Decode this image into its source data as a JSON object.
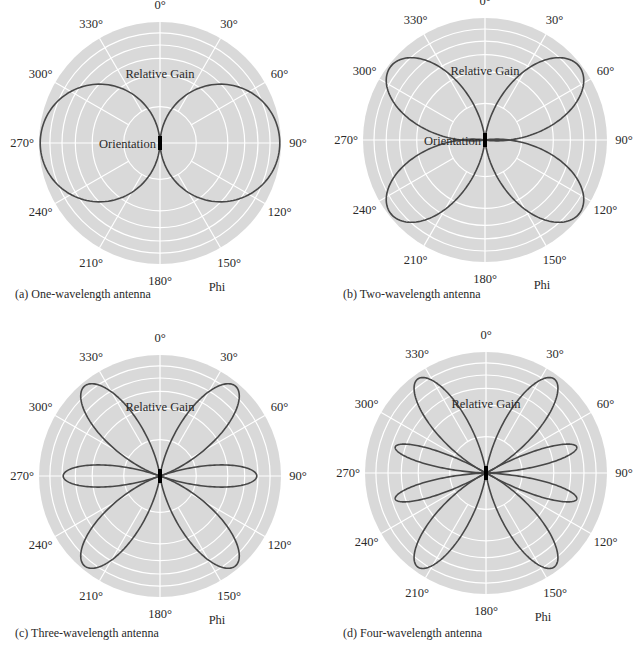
{
  "chart_data": [
    {
      "type": "polar",
      "id": "a",
      "caption": "(a) One-wavelength antenna",
      "center_px": [
        160,
        143
      ],
      "radius_px": 121,
      "angular_ticks": [
        "0°",
        "30°",
        "60°",
        "90°",
        "120°",
        "150°",
        "180°",
        "210°",
        "240°",
        "270°",
        "300°",
        "330°"
      ],
      "radial_label": "Relative Gain",
      "angle_label": "Phi",
      "center_label": "Orientation",
      "ring_fractions": [
        0.3,
        0.56,
        0.7,
        0.81,
        0.91,
        1.0
      ],
      "lobes": [
        {
          "angle_deg": 90,
          "gain": 0.99,
          "half_width_deg": 88,
          "shape": 1.0
        },
        {
          "angle_deg": 270,
          "gain": 0.99,
          "half_width_deg": 88,
          "shape": 1.0
        }
      ]
    },
    {
      "type": "polar",
      "id": "b",
      "caption": "(b) Two-wavelength antenna",
      "center_px": [
        485,
        140
      ],
      "radius_px": 122,
      "angular_ticks": [
        "0°",
        "30°",
        "60°",
        "90°",
        "120°",
        "150°",
        "180°",
        "210°",
        "240°",
        "270°",
        "300°",
        "330°"
      ],
      "radial_label": "Relative Gain",
      "angle_label": "Phi",
      "center_label": "Orientation",
      "ring_fractions": [
        0.3,
        0.56,
        0.7,
        0.81,
        0.91,
        1.0
      ],
      "lobes": [
        {
          "angle_deg": 52,
          "gain": 0.98,
          "half_width_deg": 48,
          "shape": 1.4
        },
        {
          "angle_deg": 128,
          "gain": 0.98,
          "half_width_deg": 48,
          "shape": 1.4
        },
        {
          "angle_deg": 232,
          "gain": 0.98,
          "half_width_deg": 48,
          "shape": 1.4
        },
        {
          "angle_deg": 308,
          "gain": 0.98,
          "half_width_deg": 48,
          "shape": 1.4
        }
      ]
    },
    {
      "type": "polar",
      "id": "c",
      "caption": "(c) Three-wavelength antenna",
      "center_px": [
        160,
        476
      ],
      "radius_px": 121,
      "angular_ticks": [
        "0°",
        "30°",
        "60°",
        "90°",
        "120°",
        "150°",
        "180°",
        "210°",
        "240°",
        "270°",
        "300°",
        "330°"
      ],
      "radial_label": "Relative Gain",
      "angle_label": "Phi",
      "center_label": "",
      "ring_fractions": [
        0.3,
        0.56,
        0.7,
        0.81,
        0.91,
        1.0
      ],
      "lobes": [
        {
          "angle_deg": 40,
          "gain": 0.97,
          "half_width_deg": 33,
          "shape": 1.6
        },
        {
          "angle_deg": 90,
          "gain": 0.8,
          "half_width_deg": 20,
          "shape": 1.2
        },
        {
          "angle_deg": 140,
          "gain": 0.97,
          "half_width_deg": 33,
          "shape": 1.6
        },
        {
          "angle_deg": 220,
          "gain": 0.97,
          "half_width_deg": 33,
          "shape": 1.6
        },
        {
          "angle_deg": 270,
          "gain": 0.8,
          "half_width_deg": 20,
          "shape": 1.2
        },
        {
          "angle_deg": 320,
          "gain": 0.97,
          "half_width_deg": 33,
          "shape": 1.6
        }
      ]
    },
    {
      "type": "polar",
      "id": "d",
      "caption": "(d) Four-wavelength antenna",
      "center_px": [
        486,
        473
      ],
      "radius_px": 121,
      "angular_ticks": [
        "0°",
        "30°",
        "60°",
        "90°",
        "120°",
        "150°",
        "180°",
        "210°",
        "240°",
        "270°",
        "300°",
        "330°"
      ],
      "radial_label": "Relative Gain",
      "angle_label": "Phi",
      "center_label": "",
      "ring_fractions": [
        0.3,
        0.56,
        0.7,
        0.81,
        0.91,
        1.0
      ],
      "lobes": [
        {
          "angle_deg": 36,
          "gain": 0.96,
          "half_width_deg": 30,
          "shape": 1.7
        },
        {
          "angle_deg": 74,
          "gain": 0.78,
          "half_width_deg": 14,
          "shape": 1.1
        },
        {
          "angle_deg": 106,
          "gain": 0.78,
          "half_width_deg": 14,
          "shape": 1.1
        },
        {
          "angle_deg": 144,
          "gain": 0.96,
          "half_width_deg": 30,
          "shape": 1.7
        },
        {
          "angle_deg": 216,
          "gain": 0.96,
          "half_width_deg": 30,
          "shape": 1.7
        },
        {
          "angle_deg": 254,
          "gain": 0.78,
          "half_width_deg": 14,
          "shape": 1.1
        },
        {
          "angle_deg": 286,
          "gain": 0.78,
          "half_width_deg": 14,
          "shape": 1.1
        },
        {
          "angle_deg": 324,
          "gain": 0.96,
          "half_width_deg": 30,
          "shape": 1.7
        }
      ]
    }
  ],
  "colors": {
    "plot_background": "#d9d9d9",
    "grid": "#ffffff",
    "curve": "#474747",
    "element": "#000000",
    "text": "#2a2a2a"
  }
}
